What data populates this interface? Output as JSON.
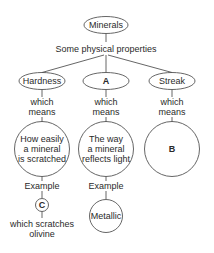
{
  "diagram": {
    "root": {
      "label": "Minerals"
    },
    "root_connector": "Some physical properties",
    "branches": [
      {
        "label": "Hardness",
        "connector": "which means",
        "definition": "How easily a mineral is scratched",
        "example_connector": "Example",
        "example": "C",
        "example_note": "which scratches olivine"
      },
      {
        "label": "A",
        "connector": "which means",
        "definition": "The way a mineral reflects light",
        "example_connector": "Example",
        "example": "Metallic"
      },
      {
        "label": "Streak",
        "connector": "which means",
        "definition": "B"
      }
    ],
    "text_lines": {
      "def_hardness": [
        "How easily",
        "a mineral",
        "is scratched"
      ],
      "def_a": [
        "The way",
        "a mineral",
        "reflects light"
      ],
      "note_c": [
        "which scratches",
        "olivine"
      ],
      "which": "which",
      "means": "means"
    }
  }
}
